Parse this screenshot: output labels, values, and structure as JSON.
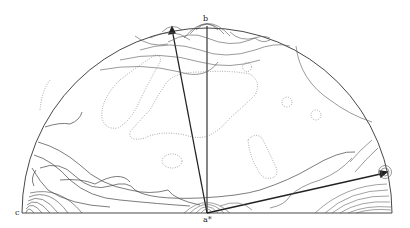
{
  "figure": {
    "type": "pole-figure",
    "shape": "half-circle",
    "labels": {
      "top": "b",
      "left": "c",
      "bottom_center": "a*"
    },
    "arrows": [
      {
        "name": "arrow-upper-left",
        "from": "a*",
        "direction": "toward upper rim near b"
      },
      {
        "name": "arrow-right",
        "from": "a*",
        "direction": "toward right rim"
      }
    ],
    "contour_styles": [
      "solid",
      "dotted"
    ],
    "colors": {
      "line": "#333333",
      "dotted": "#777777",
      "background": "#ffffff"
    }
  }
}
